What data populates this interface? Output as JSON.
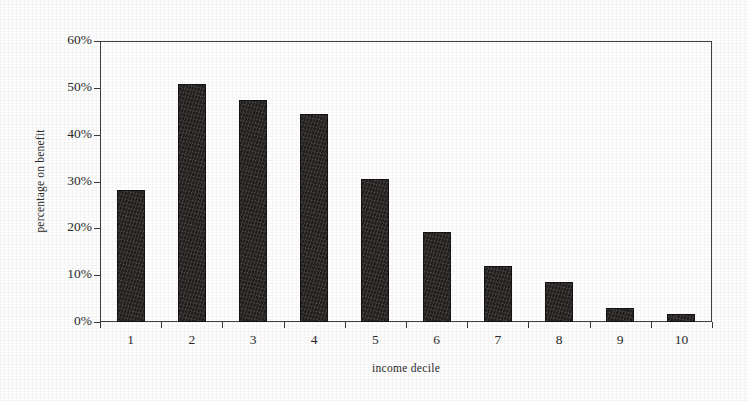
{
  "chart_data": {
    "type": "bar",
    "title": "",
    "subtitle": "",
    "xlabel": "income decile",
    "ylabel": "percentage on benefit",
    "categories": [
      "1",
      "2",
      "3",
      "4",
      "5",
      "6",
      "7",
      "8",
      "9",
      "10"
    ],
    "values": [
      28.2,
      50.8,
      47.4,
      44.4,
      30.6,
      19.2,
      12.0,
      8.5,
      3.0,
      1.7
    ],
    "series": [
      {
        "name": "percentage on benefit",
        "values": [
          28.2,
          50.8,
          47.4,
          44.4,
          30.6,
          19.2,
          12.0,
          8.5,
          3.0,
          1.7
        ]
      }
    ],
    "ylim": [
      0,
      60
    ],
    "y_tick_values": [
      0,
      10,
      20,
      30,
      40,
      50,
      60
    ],
    "y_tick_labels": [
      "0%",
      "10%",
      "20%",
      "30%",
      "40%",
      "50%",
      "60%"
    ],
    "grid": false,
    "legend": false,
    "legend_position": "none",
    "bar_color": "#241f1f",
    "axis_color": "#3f3f3f",
    "background_color": "#ffffff",
    "annotations": []
  },
  "axes": {
    "y_title": "percentage on benefit",
    "x_title": "income decile"
  }
}
